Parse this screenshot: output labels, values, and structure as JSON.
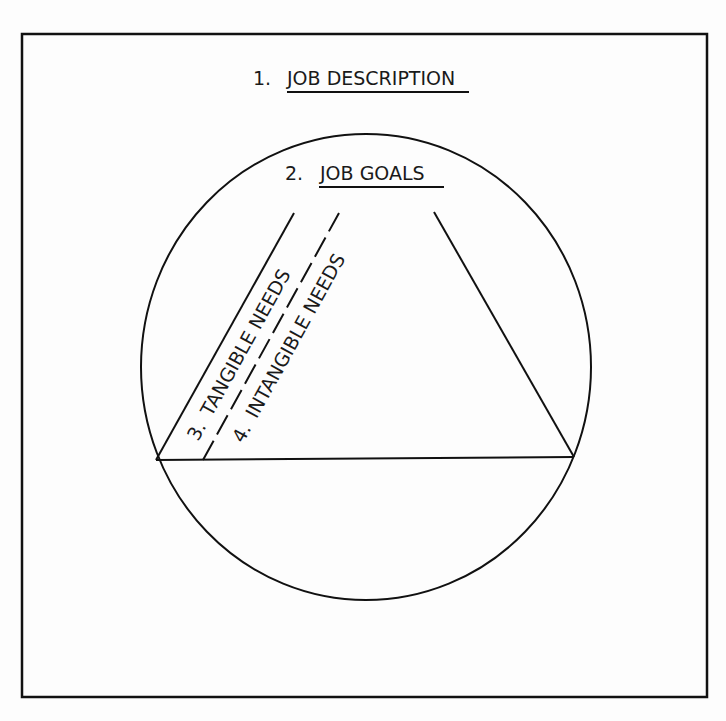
{
  "diagram": {
    "frame": {
      "x": 22,
      "y": 34,
      "width": 685,
      "height": 663
    },
    "circle": {
      "cx": 366,
      "cy": 367,
      "rx": 225,
      "ry": 233
    },
    "labels": {
      "job_description": {
        "number": "1.",
        "text": "JOB DESCRIPTION"
      },
      "job_goals": {
        "number": "2.",
        "text": "JOB GOALS"
      },
      "tangible_needs": {
        "number": "3.",
        "text": "TANGIBLE NEEDS"
      },
      "intangible_needs": {
        "number": "4.",
        "text": "INTANGIBLE NEEDS"
      }
    },
    "colors": {
      "line": "#111111",
      "background": "#fdfdfd"
    }
  }
}
